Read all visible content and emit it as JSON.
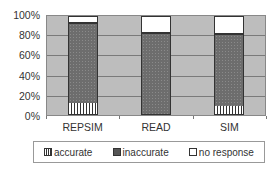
{
  "chart_data": {
    "type": "bar",
    "stacked": true,
    "percent": true,
    "title": "",
    "xlabel": "",
    "ylabel": "",
    "categories": [
      "REPSIM",
      "READ",
      "SIM"
    ],
    "series": [
      {
        "name": "accurate",
        "values": [
          11,
          0,
          8
        ]
      },
      {
        "name": "inaccurate",
        "values": [
          83,
          84,
          74
        ]
      },
      {
        "name": "no response",
        "values": [
          6,
          16,
          18
        ]
      }
    ],
    "yticks": [
      "0%",
      "20%",
      "40%",
      "60%",
      "80%",
      "100%"
    ],
    "ylim": [
      0,
      100
    ],
    "grid": true,
    "legend_position": "bottom"
  },
  "legend": {
    "items": [
      {
        "label": "accurate",
        "key": "acc"
      },
      {
        "label": "inaccurate",
        "key": "inacc"
      },
      {
        "label": "no response",
        "key": "nr"
      }
    ]
  }
}
